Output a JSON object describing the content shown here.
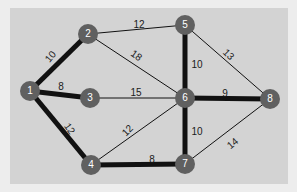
{
  "diagram": {
    "type": "weighted-undirected-graph",
    "colors": {
      "page_background": "#ededed",
      "panel_background": "#d3d3d3",
      "node_fill": "#606060",
      "node_text": "#ffffff",
      "edge": "#111111"
    },
    "nodes": [
      {
        "id": "1",
        "label": "1",
        "x": 30,
        "y": 91
      },
      {
        "id": "2",
        "label": "2",
        "x": 88,
        "y": 34
      },
      {
        "id": "3",
        "label": "3",
        "x": 90,
        "y": 98
      },
      {
        "id": "4",
        "label": "4",
        "x": 91,
        "y": 165
      },
      {
        "id": "5",
        "label": "5",
        "x": 185,
        "y": 25
      },
      {
        "id": "6",
        "label": "6",
        "x": 185,
        "y": 98
      },
      {
        "id": "7",
        "label": "7",
        "x": 185,
        "y": 164
      },
      {
        "id": "8",
        "label": "8",
        "x": 270,
        "y": 99
      }
    ],
    "edges": [
      {
        "from": "1",
        "to": "2",
        "weight": "10",
        "highlighted": true,
        "lx": 51,
        "ly": 57,
        "rot": -50
      },
      {
        "from": "1",
        "to": "3",
        "weight": "8",
        "highlighted": true,
        "lx": 61,
        "ly": 87,
        "rot": 0
      },
      {
        "from": "1",
        "to": "4",
        "weight": "12",
        "highlighted": true,
        "lx": 69,
        "ly": 129,
        "rot": 55
      },
      {
        "from": "2",
        "to": "5",
        "weight": "12",
        "highlighted": false,
        "lx": 139,
        "ly": 25,
        "rot": 0
      },
      {
        "from": "2",
        "to": "6",
        "weight": "18",
        "highlighted": false,
        "lx": 136,
        "ly": 56,
        "rot": 35
      },
      {
        "from": "3",
        "to": "6",
        "weight": "15",
        "highlighted": false,
        "lx": 136,
        "ly": 93,
        "rot": 0
      },
      {
        "from": "4",
        "to": "6",
        "weight": "12",
        "highlighted": false,
        "lx": 128,
        "ly": 131,
        "rot": -45
      },
      {
        "from": "4",
        "to": "7",
        "weight": "8",
        "highlighted": true,
        "lx": 152,
        "ly": 160,
        "rot": 0
      },
      {
        "from": "5",
        "to": "6",
        "weight": "10",
        "highlighted": true,
        "lx": 197,
        "ly": 65,
        "rot": 0
      },
      {
        "from": "5",
        "to": "8",
        "weight": "13",
        "highlighted": false,
        "lx": 228,
        "ly": 55,
        "rot": 45
      },
      {
        "from": "6",
        "to": "8",
        "weight": "9",
        "highlighted": true,
        "lx": 225,
        "ly": 94,
        "rot": 0
      },
      {
        "from": "6",
        "to": "7",
        "weight": "10",
        "highlighted": true,
        "lx": 197,
        "ly": 132,
        "rot": 0
      },
      {
        "from": "7",
        "to": "8",
        "weight": "14",
        "highlighted": false,
        "lx": 233,
        "ly": 144,
        "rot": -40
      }
    ]
  }
}
